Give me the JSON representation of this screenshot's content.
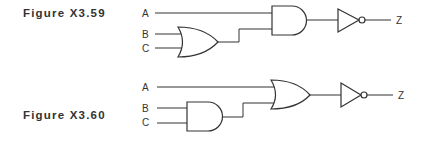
{
  "figures": [
    {
      "label": "Figure X3.59",
      "inputs": [
        "A",
        "B",
        "C"
      ],
      "first_gate": "OR",
      "first_gate_inputs": [
        "B",
        "C"
      ],
      "second_gate": "AND",
      "second_gate_inputs": [
        "A",
        "OR(B,C)"
      ],
      "output_gate": "NOT",
      "output": "Z",
      "expression": "Z = NOT(A AND (B OR C))"
    },
    {
      "label": "Figure X3.60",
      "inputs": [
        "A",
        "B",
        "C"
      ],
      "first_gate": "AND",
      "first_gate_inputs": [
        "B",
        "C"
      ],
      "second_gate": "OR",
      "second_gate_inputs": [
        "A",
        "AND(B,C)"
      ],
      "output_gate": "NOT",
      "output": "Z",
      "expression": "Z = NOT(A OR (B AND C))"
    }
  ],
  "colors": {
    "line": "#333333",
    "background": "#ffffff"
  }
}
